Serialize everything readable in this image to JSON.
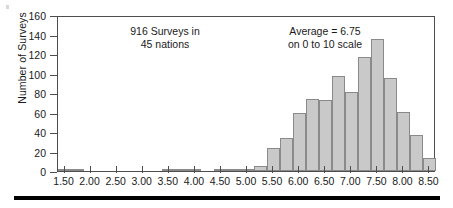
{
  "figure": {
    "background": "#ffffff",
    "bar_fill": "#c9c9c9",
    "bar_edge": "#8a8a8a",
    "axis_color": "#4d4d4d",
    "rule_color": "#000000"
  },
  "annotations": {
    "left": {
      "line1": "916 Surveys in",
      "line2": "45 nations"
    },
    "right": {
      "line1": "Average = 6.75",
      "line2": "on 0 to 10 scale"
    }
  },
  "chart_data": {
    "type": "bar",
    "title": "",
    "subtitle": "",
    "xlabel": "",
    "ylabel": "Number of Surveys",
    "xlim": [
      1.375,
      8.625
    ],
    "ylim": [
      0,
      160
    ],
    "grid": false,
    "legend": null,
    "bin_width": 0.25,
    "xticks": [
      1.5,
      2.0,
      2.5,
      3.0,
      3.5,
      4.0,
      4.5,
      5.0,
      5.5,
      6.0,
      6.5,
      7.0,
      7.5,
      8.0,
      8.5
    ],
    "xticklabels": [
      "1.50",
      "2.00",
      "2.50",
      "3.00",
      "3.50",
      "4.00",
      "4.50",
      "5.00",
      "5.50",
      "6.00",
      "6.50",
      "7.00",
      "7.50",
      "8.00",
      "8.50"
    ],
    "yticks": [
      0,
      20,
      40,
      60,
      80,
      100,
      120,
      140,
      160
    ],
    "yticklabels": [
      "0",
      "20",
      "40",
      "60",
      "80",
      "100",
      "120",
      "140",
      "160"
    ],
    "bin_starts": [
      1.375,
      1.625,
      1.875,
      2.125,
      2.375,
      2.625,
      2.875,
      3.125,
      3.375,
      3.625,
      3.875,
      4.125,
      4.375,
      4.625,
      4.875,
      5.125,
      5.375,
      5.625,
      5.875,
      6.125,
      6.375,
      6.625,
      6.875,
      7.125,
      7.375,
      7.625,
      7.875,
      8.125,
      8.375
    ],
    "categories": [
      "1.50",
      "1.75",
      "2.00",
      "2.25",
      "2.50",
      "2.75",
      "3.00",
      "3.25",
      "3.50",
      "3.75",
      "4.00",
      "4.25",
      "4.50",
      "4.75",
      "5.00",
      "5.25",
      "5.50",
      "5.75",
      "6.00",
      "6.25",
      "6.50",
      "6.75",
      "7.00",
      "7.25",
      "7.50",
      "7.75",
      "8.00",
      "8.25",
      "8.50"
    ],
    "values": [
      2,
      2,
      0,
      0,
      0,
      0,
      0,
      0,
      2,
      2,
      1,
      0,
      1,
      1,
      2,
      5,
      24,
      34,
      59,
      74,
      73,
      97,
      81,
      117,
      135,
      95,
      61,
      37,
      13
    ],
    "annotations": [
      {
        "text": "916 Surveys in\n45 nations",
        "x": 3.1,
        "y": 142
      },
      {
        "text": "Average = 6.75\non 0 to 10 scale",
        "x": 6.35,
        "y": 142
      }
    ],
    "total_surveys": 916,
    "nations": 45,
    "average": 6.75,
    "scale": "0 to 10"
  }
}
